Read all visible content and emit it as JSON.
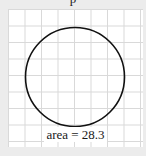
{
  "diagram": {
    "top_label": "p",
    "grid": {
      "spacing_px": 16.5,
      "line_color": "#d9d9d9"
    },
    "circle": {
      "cx": 75,
      "cy": 77,
      "r": 49,
      "stroke": "#111111"
    },
    "area_label": "area = 28.3"
  }
}
